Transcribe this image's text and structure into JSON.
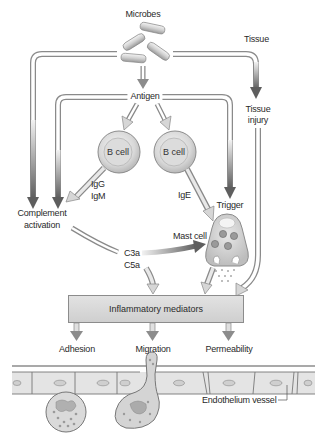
{
  "labels": {
    "microbes": "Microbes",
    "tissue": "Tissue",
    "antigen": "Antigen",
    "tissue_injury_1": "Tissue",
    "tissue_injury_2": "injury",
    "b_cell_left": "B cell",
    "b_cell_right": "B cell",
    "igg": "IgG",
    "igm": "IgM",
    "ige": "IgE",
    "trigger": "Trigger",
    "complement_1": "Complement",
    "complement_2": "activation",
    "c3a": "C3a",
    "c5a": "C5a",
    "mast_cell": "Mast cell",
    "inflammatory_mediators": "Inflammatory mediators",
    "adhesion": "Adhesion",
    "migration": "Migration",
    "permeability": "Permeability",
    "endothelium_vessel": "Endothelium vessel"
  },
  "colors": {
    "dark_arrow": "#6b6b6b",
    "light_arrow": "#d6d6d6",
    "outline": "#8a8a8a",
    "box_fill": "#d9d9d9"
  }
}
